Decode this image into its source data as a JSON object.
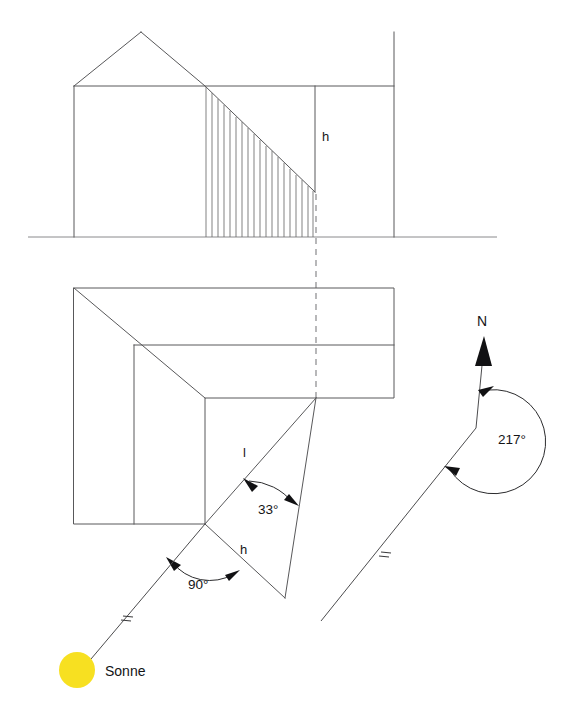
{
  "figure": {
    "background_color": "#ffffff",
    "line_color": "#58585a",
    "sun_color": "#f7e021",
    "width": 561,
    "height": 720
  },
  "elevation": {
    "name": "Aufriss",
    "height_label": "h",
    "ground_line": true
  },
  "plan": {
    "name": "Grundriss",
    "shadow_length_label": "l",
    "shadow_height_label": "h",
    "angle_elevation": "33°",
    "angle_right": "90°"
  },
  "compass": {
    "north_label": "N",
    "azimuth_label": "217°"
  },
  "sun": {
    "label": "Sonne",
    "color": "#f7e021"
  },
  "footer": {
    "caption": ""
  }
}
